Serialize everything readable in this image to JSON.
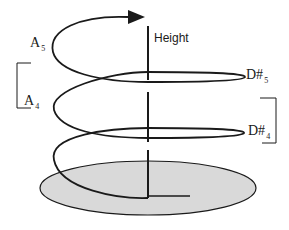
{
  "diagram": {
    "type": "pitch-helix",
    "axis_label": "Height",
    "labels": {
      "a5": {
        "base": "A",
        "sub": "5"
      },
      "a4": {
        "base": "A",
        "sub": "4"
      },
      "d5": {
        "base": "D#",
        "sub": "5"
      },
      "d4": {
        "base": "D#",
        "sub": "4"
      }
    },
    "colors": {
      "stroke": "#1a1a1a",
      "base_fill": "#d9d9d9"
    }
  }
}
